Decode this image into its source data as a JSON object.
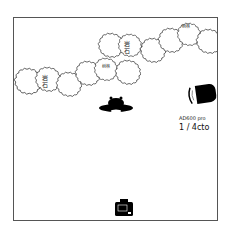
{
  "diagram": {
    "type": "lighting-setup",
    "background_color": "#ffffff",
    "border_color": "#555555",
    "foliage_labels": [
      {
        "text": "岩石",
        "x": 44,
        "y": 74
      },
      {
        "text": "树林",
        "x": 103,
        "y": 64
      },
      {
        "text": "岩石",
        "x": 125,
        "y": 40
      },
      {
        "text": "树林",
        "x": 183,
        "y": 26
      }
    ],
    "light": {
      "name": "AD600 pro",
      "modifier": "1 / 4cto"
    },
    "subject": {
      "icon": "person-top-view-icon"
    },
    "camera": {
      "icon": "camera-icon"
    }
  }
}
